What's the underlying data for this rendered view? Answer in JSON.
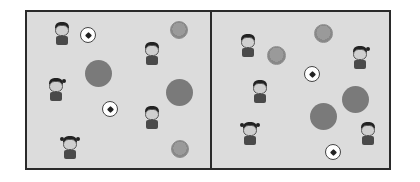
{
  "scene": {
    "description": "Two side-by-side panels with children, soccer balls, small textured balls and large gray circles",
    "colors": {
      "background": "#dcdcdc",
      "border": "#2a2a2a",
      "large_circle": "#7a7a7a",
      "textured_ball": "#999999",
      "soccer_ball": "#ffffff"
    },
    "panels": [
      {
        "name": "left",
        "children": [
          {
            "x": 52,
            "y": 22,
            "type": "boy"
          },
          {
            "x": 142,
            "y": 42,
            "type": "boy"
          },
          {
            "x": 46,
            "y": 78,
            "type": "girl-ponytail"
          },
          {
            "x": 142,
            "y": 106,
            "type": "boy"
          },
          {
            "x": 60,
            "y": 136,
            "type": "girl-pigtails"
          }
        ],
        "soccer_balls": [
          {
            "x": 80,
            "y": 27,
            "size": 16
          },
          {
            "x": 102,
            "y": 101,
            "size": 16
          }
        ],
        "textured_balls": [
          {
            "x": 170,
            "y": 21,
            "size": 18
          },
          {
            "x": 171,
            "y": 140,
            "size": 18
          }
        ],
        "large_circles": [
          {
            "x": 85,
            "y": 60,
            "size": 27
          },
          {
            "x": 166,
            "y": 79,
            "size": 27
          }
        ]
      },
      {
        "name": "right",
        "children": [
          {
            "x": 238,
            "y": 34,
            "type": "boy"
          },
          {
            "x": 350,
            "y": 46,
            "type": "girl-ponytail"
          },
          {
            "x": 250,
            "y": 80,
            "type": "boy"
          },
          {
            "x": 240,
            "y": 122,
            "type": "girl-pigtails"
          },
          {
            "x": 358,
            "y": 122,
            "type": "boy"
          }
        ],
        "soccer_balls": [
          {
            "x": 304,
            "y": 66,
            "size": 16
          },
          {
            "x": 325,
            "y": 144,
            "size": 16
          }
        ],
        "textured_balls": [
          {
            "x": 314,
            "y": 24,
            "size": 19
          },
          {
            "x": 267,
            "y": 46,
            "size": 19
          }
        ],
        "large_circles": [
          {
            "x": 342,
            "y": 86,
            "size": 27
          },
          {
            "x": 310,
            "y": 103,
            "size": 27
          }
        ]
      }
    ]
  }
}
